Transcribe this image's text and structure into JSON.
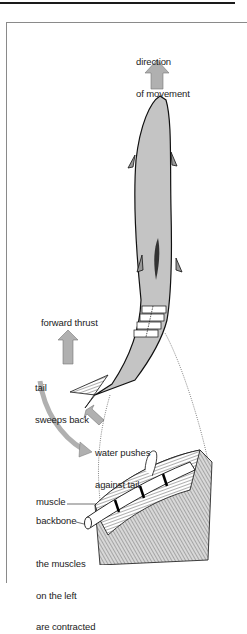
{
  "figure": {
    "labels": {
      "direction_line1": "direction",
      "direction_line2": "of movement",
      "forward_thrust": "forward thrust",
      "tail_line1": "tail",
      "tail_line2": "sweeps back",
      "water_line1": "water pushes",
      "water_line2": "against tail",
      "muscle": "muscle",
      "backbone": "backbone",
      "muscles_line1": "the muscles",
      "muscles_line2": "on the left",
      "muscles_line3": "are contracted"
    },
    "colors": {
      "fish_body": "#c4c4c4",
      "arrow": "#b0b0b0",
      "outline": "#111111",
      "frame": "#8a8a8a"
    }
  }
}
